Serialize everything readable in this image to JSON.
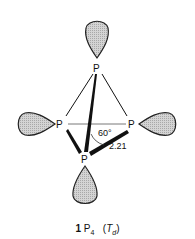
{
  "diagram": {
    "atoms": [
      {
        "id": "top",
        "label": "P"
      },
      {
        "id": "left",
        "label": "P"
      },
      {
        "id": "right",
        "label": "P"
      },
      {
        "id": "bottom",
        "label": "P"
      }
    ],
    "angle_label": "60°",
    "bond_length_label": "2.21",
    "lobe_fill": "#c8c8c8",
    "lobe_stroke": "#222222"
  },
  "caption": {
    "number": "1",
    "formula": "P",
    "subscript": "4",
    "symmetry_open": "(",
    "symmetry_symbol": "T",
    "symmetry_subscript": "d",
    "symmetry_close": ")"
  }
}
